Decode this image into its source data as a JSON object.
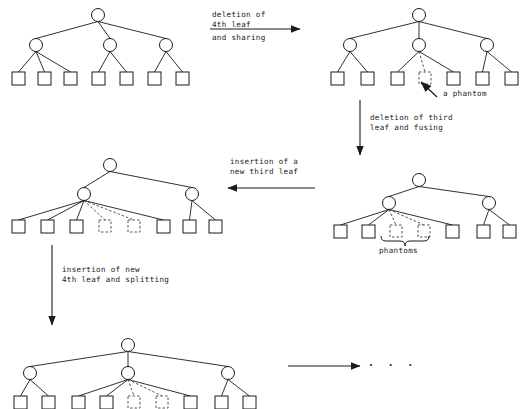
{
  "figure": {
    "colors": {
      "stroke": "#1a1a1a",
      "phantom": "#555555",
      "background": "#ffffff",
      "text": "#1a1a1a"
    }
  },
  "annotations": {
    "a_phantom": "a phantom",
    "phantoms": "phantoms",
    "ellipsis": "· · ·"
  },
  "arrows": [
    {
      "id": "arrow-1",
      "dir": "right",
      "label_above": "deletion of\n4th leaf",
      "label_below": "and sharing"
    },
    {
      "id": "arrow-2",
      "dir": "down",
      "label_above": "deletion of third\nleaf and fusing",
      "label_below": ""
    },
    {
      "id": "arrow-3",
      "dir": "left",
      "label_above": "insertion of a\nnew third leaf",
      "label_below": ""
    },
    {
      "id": "arrow-4",
      "dir": "down",
      "label_above": "insertion of new\n4th leaf and splitting",
      "label_below": ""
    },
    {
      "id": "arrow-5",
      "dir": "right",
      "label_above": "",
      "label_below": ""
    }
  ],
  "trees": [
    {
      "id": "tree-1-initial",
      "name": "initial-tree",
      "root": {
        "x": 98,
        "y": 15
      },
      "internals": [
        {
          "x": 36,
          "y": 45
        },
        {
          "x": 110,
          "y": 45
        },
        {
          "x": 166,
          "y": 45
        }
      ],
      "leaves": [
        {
          "x": 12,
          "y": 72,
          "parent": 0,
          "phantom": false
        },
        {
          "x": 38,
          "y": 72,
          "parent": 0,
          "phantom": false
        },
        {
          "x": 64,
          "y": 72,
          "parent": 0,
          "phantom": false
        },
        {
          "x": 92,
          "y": 72,
          "parent": 1,
          "phantom": false
        },
        {
          "x": 120,
          "y": 72,
          "parent": 1,
          "phantom": false
        },
        {
          "x": 148,
          "y": 72,
          "parent": 2,
          "phantom": false
        },
        {
          "x": 176,
          "y": 72,
          "parent": 2,
          "phantom": false
        }
      ]
    },
    {
      "id": "tree-2-after-sharing",
      "name": "tree-after-deletion-and-sharing",
      "root": {
        "x": 419,
        "y": 15
      },
      "internals": [
        {
          "x": 350,
          "y": 45
        },
        {
          "x": 419,
          "y": 45
        },
        {
          "x": 487,
          "y": 45
        }
      ],
      "leaves": [
        {
          "x": 331,
          "y": 72,
          "parent": 0,
          "phantom": false
        },
        {
          "x": 361,
          "y": 72,
          "parent": 0,
          "phantom": false
        },
        {
          "x": 391,
          "y": 72,
          "parent": 1,
          "phantom": false
        },
        {
          "x": 419,
          "y": 72,
          "parent": 1,
          "phantom": true
        },
        {
          "x": 447,
          "y": 72,
          "parent": 1,
          "phantom": false
        },
        {
          "x": 476,
          "y": 72,
          "parent": 2,
          "phantom": false
        },
        {
          "x": 505,
          "y": 72,
          "parent": 2,
          "phantom": false
        }
      ]
    },
    {
      "id": "tree-3-after-fusing",
      "name": "tree-after-fusing",
      "root": {
        "x": 419,
        "y": 180
      },
      "internals": [
        {
          "x": 389,
          "y": 203
        },
        {
          "x": 489,
          "y": 203
        }
      ],
      "leaves": [
        {
          "x": 334,
          "y": 225,
          "parent": 0,
          "phantom": false
        },
        {
          "x": 362,
          "y": 225,
          "parent": 0,
          "phantom": false
        },
        {
          "x": 390,
          "y": 225,
          "parent": 0,
          "phantom": true
        },
        {
          "x": 418,
          "y": 225,
          "parent": 0,
          "phantom": true
        },
        {
          "x": 446,
          "y": 225,
          "parent": 0,
          "phantom": false
        },
        {
          "x": 477,
          "y": 225,
          "parent": 1,
          "phantom": false
        },
        {
          "x": 503,
          "y": 225,
          "parent": 1,
          "phantom": false
        }
      ]
    },
    {
      "id": "tree-4-after-insertion",
      "name": "tree-after-third-leaf-insertion",
      "root": {
        "x": 110,
        "y": 165
      },
      "internals": [
        {
          "x": 84,
          "y": 194
        },
        {
          "x": 192,
          "y": 194
        }
      ],
      "leaves": [
        {
          "x": 12,
          "y": 220,
          "parent": 0,
          "phantom": false
        },
        {
          "x": 41,
          "y": 220,
          "parent": 0,
          "phantom": false
        },
        {
          "x": 70,
          "y": 220,
          "parent": 0,
          "phantom": false
        },
        {
          "x": 99,
          "y": 220,
          "parent": 0,
          "phantom": true
        },
        {
          "x": 128,
          "y": 220,
          "parent": 0,
          "phantom": true
        },
        {
          "x": 157,
          "y": 220,
          "parent": 0,
          "phantom": false
        },
        {
          "x": 183,
          "y": 220,
          "parent": 1,
          "phantom": false
        },
        {
          "x": 209,
          "y": 220,
          "parent": 1,
          "phantom": false
        }
      ]
    },
    {
      "id": "tree-5-after-splitting",
      "name": "tree-after-splitting",
      "root": {
        "x": 128,
        "y": 345
      },
      "internals": [
        {
          "x": 30,
          "y": 373
        },
        {
          "x": 128,
          "y": 373
        },
        {
          "x": 228,
          "y": 373
        }
      ],
      "leaves": [
        {
          "x": 14,
          "y": 396,
          "parent": 0,
          "phantom": false
        },
        {
          "x": 42,
          "y": 396,
          "parent": 0,
          "phantom": false
        },
        {
          "x": 72,
          "y": 396,
          "parent": 1,
          "phantom": false
        },
        {
          "x": 100,
          "y": 396,
          "parent": 1,
          "phantom": false
        },
        {
          "x": 128,
          "y": 396,
          "parent": 1,
          "phantom": true
        },
        {
          "x": 156,
          "y": 396,
          "parent": 1,
          "phantom": true
        },
        {
          "x": 184,
          "y": 396,
          "parent": 1,
          "phantom": false
        },
        {
          "x": 215,
          "y": 396,
          "parent": 2,
          "phantom": false
        },
        {
          "x": 243,
          "y": 396,
          "parent": 2,
          "phantom": false
        }
      ]
    }
  ],
  "geometry": {
    "node_radius": 6.5,
    "leaf_size": 13,
    "phantom_leaf_size": 12
  }
}
